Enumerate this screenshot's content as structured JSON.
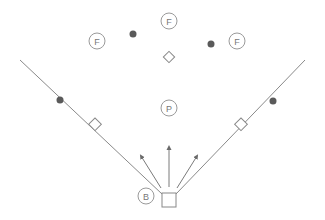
{
  "diagram": {
    "title": "",
    "colors": {
      "line": "#8a8a8a",
      "circle_stroke": "#9a9a9a",
      "dot": "#5a5a5a",
      "base_stroke": "#888888",
      "background": "#ffffff"
    },
    "players": [
      {
        "id": "fielder-left",
        "label": "F",
        "x": 97,
        "y": 41
      },
      {
        "id": "fielder-center",
        "label": "F",
        "x": 169,
        "y": 21
      },
      {
        "id": "fielder-right",
        "label": "F",
        "x": 237,
        "y": 41
      },
      {
        "id": "pitcher",
        "label": "P",
        "x": 169,
        "y": 108
      },
      {
        "id": "batter",
        "label": "B",
        "x": 146,
        "y": 196
      }
    ],
    "markers": [
      {
        "id": "dot-left-field",
        "x": 133,
        "y": 34
      },
      {
        "id": "dot-right-field",
        "x": 211,
        "y": 44
      },
      {
        "id": "dot-left-line",
        "x": 60,
        "y": 100
      },
      {
        "id": "dot-right-line",
        "x": 273,
        "y": 101
      }
    ],
    "bases": {
      "second": {
        "x": 169,
        "y": 57
      },
      "third": {
        "x": 95,
        "y": 125
      },
      "first": {
        "x": 241,
        "y": 125
      },
      "home": {
        "x": 169,
        "y": 200
      }
    },
    "arrows": [
      {
        "id": "arrow-left",
        "x1": 161,
        "y1": 188,
        "x2": 140,
        "y2": 155
      },
      {
        "id": "arrow-center",
        "x1": 169,
        "y1": 187,
        "x2": 169,
        "y2": 145
      },
      {
        "id": "arrow-right",
        "x1": 177,
        "y1": 188,
        "x2": 198,
        "y2": 155
      }
    ]
  }
}
